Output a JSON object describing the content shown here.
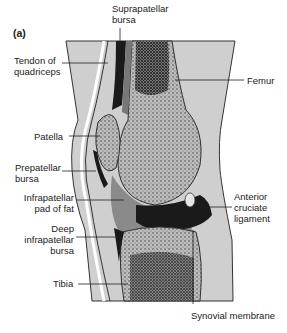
{
  "figure": {
    "panel_label": "(a)",
    "colors": {
      "soft_tissue": "#cfcfcf",
      "bone": "#bdbdbd",
      "bursa_dark": "#1a1a1a",
      "fat_pad": "#8a8a8a",
      "outline": "#333333"
    },
    "labels": {
      "suprapatellar_bursa": [
        "Suprapatellar",
        "bursa"
      ],
      "tendon_of_quadriceps": [
        "Tendon of",
        "quadriceps"
      ],
      "femur": "Femur",
      "patella": "Patella",
      "prepatellar_bursa": [
        "Prepatellar",
        "bursa"
      ],
      "infrapatellar_pad_of_fat": [
        "Infrapatellar",
        "pad of fat"
      ],
      "anterior_cruciate_ligament": [
        "Anterior",
        "cruciate",
        "ligament"
      ],
      "deep_infrapatellar_bursa": [
        "Deep",
        "infrapatellar",
        "bursa"
      ],
      "tibia": "Tibia",
      "synovial_membrane": "Synovial membrane"
    }
  }
}
